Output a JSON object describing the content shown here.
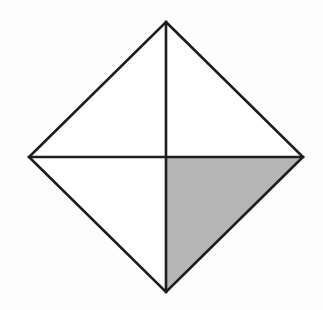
{
  "figure": {
    "kind": "geometry-diagram",
    "canvas": {
      "width": 323,
      "height": 310,
      "background_color": "#fdfdfd"
    },
    "colors": {
      "stroke": "#1d1d1d",
      "shaded_fill": "#b5b5b5",
      "unshaded_fill": "#ffffff",
      "background": "#fdfdfd"
    },
    "stroke_width": 2.6,
    "vertices": {
      "top": {
        "label": "top",
        "x": 166,
        "y": 22
      },
      "right": {
        "label": "right",
        "x": 303,
        "y": 157
      },
      "bottom": {
        "label": "bottom",
        "x": 166,
        "y": 292
      },
      "left": {
        "label": "left",
        "x": 29,
        "y": 157
      },
      "center": {
        "label": "center",
        "x": 166,
        "y": 157
      }
    },
    "outline_points": "166,22 303,157 166,292 29,157",
    "regions": [
      {
        "name": "top-left-triangle",
        "points": "166,22 166,157 29,157",
        "fill": "#ffffff",
        "shaded": false
      },
      {
        "name": "top-right-triangle",
        "points": "166,22 303,157 166,157",
        "fill": "#ffffff",
        "shaded": false
      },
      {
        "name": "bottom-left-triangle",
        "points": "29,157 166,157 166,292",
        "fill": "#ffffff",
        "shaded": false
      },
      {
        "name": "bottom-right-triangle",
        "points": "166,157 303,157 166,292",
        "fill": "#b5b5b5",
        "shaded": true
      }
    ],
    "diagonals": [
      {
        "name": "vertical-diagonal",
        "x1": 166,
        "y1": 22,
        "x2": 166,
        "y2": 292
      },
      {
        "name": "horizontal-diagonal",
        "x1": 29,
        "y1": 157,
        "x2": 303,
        "y2": 157
      }
    ],
    "edges": [
      {
        "name": "upper-left-edge",
        "x1": 166,
        "y1": 22,
        "x2": 29,
        "y2": 157
      },
      {
        "name": "upper-right-edge",
        "x1": 166,
        "y1": 22,
        "x2": 303,
        "y2": 157
      },
      {
        "name": "lower-right-edge",
        "x1": 303,
        "y1": 157,
        "x2": 166,
        "y2": 292
      },
      {
        "name": "lower-left-edge",
        "x1": 166,
        "y1": 292,
        "x2": 29,
        "y2": 157
      }
    ],
    "shaded_fraction": "1/4"
  }
}
